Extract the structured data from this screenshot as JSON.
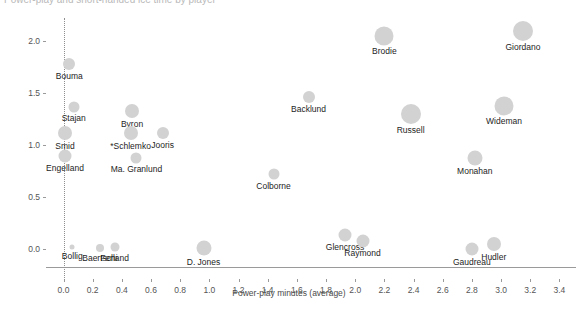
{
  "header": {
    "clipped_title": "Power-play and short-handed ice time by player"
  },
  "chart_data": {
    "type": "scatter",
    "title": "",
    "xlabel": "Power-play minutes (average)",
    "ylabel": "Short-handed minutes (average)",
    "xlim": [
      -0.12,
      3.5
    ],
    "ylim": [
      -0.17,
      2.28
    ],
    "xticks": [
      "0.0",
      "0.2",
      "0.4",
      "0.6",
      "0.8",
      "1.0",
      "1.2",
      "1.4",
      "1.6",
      "1.8",
      "2.0",
      "2.2",
      "2.4",
      "2.6",
      "2.8",
      "3.0",
      "3.2",
      "3.4"
    ],
    "xtick_values": [
      0.0,
      0.2,
      0.4,
      0.6,
      0.8,
      1.0,
      1.2,
      1.4,
      1.6,
      1.8,
      2.0,
      2.2,
      2.4,
      2.6,
      2.8,
      3.0,
      3.2,
      3.4
    ],
    "yticks": [
      "0.0",
      "0.5",
      "1.0",
      "1.5",
      "2.0"
    ],
    "ytick_values": [
      0.0,
      0.5,
      1.0,
      1.5,
      2.0
    ],
    "grid": false,
    "reference_line_x": 0.0,
    "marker_color": "#d2d2d2",
    "points": [
      {
        "label": "Giordano",
        "x": 3.15,
        "y": 2.1,
        "size": 20
      },
      {
        "label": "Brodie",
        "x": 2.2,
        "y": 2.05,
        "size": 19
      },
      {
        "label": "Bouma",
        "x": 0.04,
        "y": 1.78,
        "size": 12
      },
      {
        "label": "Backlund",
        "x": 1.68,
        "y": 1.46,
        "size": 12
      },
      {
        "label": "Wideman",
        "x": 3.02,
        "y": 1.38,
        "size": 19
      },
      {
        "label": "Russell",
        "x": 2.38,
        "y": 1.3,
        "size": 20
      },
      {
        "label": "Stajan",
        "x": 0.07,
        "y": 1.37,
        "size": 11
      },
      {
        "label": "Byron",
        "x": 0.47,
        "y": 1.33,
        "size": 14
      },
      {
        "label": "Smid",
        "x": 0.01,
        "y": 1.12,
        "size": 14
      },
      {
        "label": "*Schlemko",
        "x": 0.46,
        "y": 1.12,
        "size": 14
      },
      {
        "label": "Jooris",
        "x": 0.68,
        "y": 1.12,
        "size": 12
      },
      {
        "label": "Engelland",
        "x": 0.01,
        "y": 0.9,
        "size": 13
      },
      {
        "label": "Ma. Granlund",
        "x": 0.5,
        "y": 0.88,
        "size": 11
      },
      {
        "label": "Monahan",
        "x": 2.82,
        "y": 0.88,
        "size": 15
      },
      {
        "label": "Colborne",
        "x": 1.44,
        "y": 0.72,
        "size": 11
      },
      {
        "label": "Glencross",
        "x": 1.93,
        "y": 0.14,
        "size": 13
      },
      {
        "label": "Raymond",
        "x": 2.05,
        "y": 0.08,
        "size": 13
      },
      {
        "label": "Hudler",
        "x": 2.95,
        "y": 0.05,
        "size": 14
      },
      {
        "label": "Gaudreau",
        "x": 2.8,
        "y": 0.0,
        "size": 13
      },
      {
        "label": "D. Jones",
        "x": 0.96,
        "y": 0.01,
        "size": 15
      },
      {
        "label": "Bollig",
        "x": 0.06,
        "y": 0.02,
        "size": 5
      },
      {
        "label": "Baertschi",
        "x": 0.25,
        "y": 0.01,
        "size": 8
      },
      {
        "label": "Ferland",
        "x": 0.35,
        "y": 0.02,
        "size": 9
      }
    ]
  }
}
